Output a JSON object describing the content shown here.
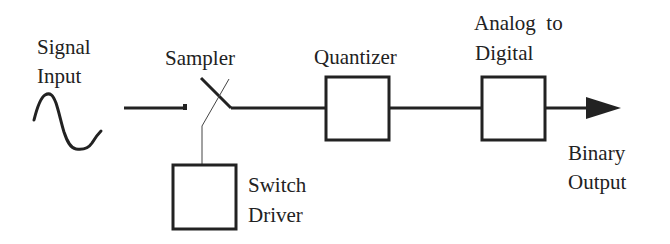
{
  "diagram": {
    "type": "block-diagram",
    "colors": {
      "stroke": "#222222",
      "background": "#ffffff"
    },
    "labels": {
      "signal_input": [
        "Signal",
        "Input"
      ],
      "sampler": "Sampler",
      "quantizer": "Quantizer",
      "adc": [
        "Analog  to",
        "Digital"
      ],
      "switch_driver": [
        "Switch",
        "Driver"
      ],
      "binary_output": [
        "Binary",
        "Output"
      ]
    },
    "nodes": [
      {
        "id": "signal-input",
        "label": "Signal Input",
        "shape": "sine-wave"
      },
      {
        "id": "sampler",
        "label": "Sampler",
        "shape": "switch"
      },
      {
        "id": "switch-driver",
        "label": "Switch Driver",
        "shape": "box"
      },
      {
        "id": "quantizer",
        "label": "Quantizer",
        "shape": "box"
      },
      {
        "id": "adc",
        "label": "Analog to Digital",
        "shape": "box"
      },
      {
        "id": "binary-output",
        "label": "Binary Output",
        "shape": "arrow-end"
      }
    ],
    "edges": [
      {
        "from": "signal-input",
        "to": "sampler"
      },
      {
        "from": "switch-driver",
        "to": "sampler",
        "style": "thin"
      },
      {
        "from": "sampler",
        "to": "quantizer"
      },
      {
        "from": "quantizer",
        "to": "adc"
      },
      {
        "from": "adc",
        "to": "binary-output",
        "arrow": true
      }
    ]
  }
}
